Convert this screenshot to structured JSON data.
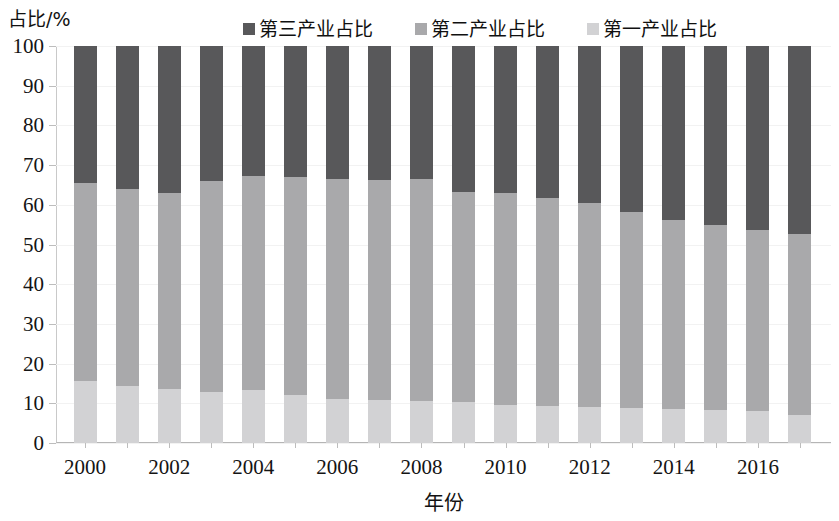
{
  "chart_data": {
    "type": "bar",
    "stacked": true,
    "title": "",
    "xlabel": "年份",
    "ylabel": "占比/%",
    "ylim": [
      0,
      100
    ],
    "yticks": [
      0,
      10,
      20,
      30,
      40,
      50,
      60,
      70,
      80,
      90,
      100
    ],
    "grid": false,
    "legend_position": "top",
    "categories": [
      "2000",
      "2001",
      "2002",
      "2003",
      "2004",
      "2005",
      "2006",
      "2007",
      "2008",
      "2009",
      "2010",
      "2011",
      "2012",
      "2013",
      "2014",
      "2015",
      "2016",
      "2017"
    ],
    "xtick_labels": [
      "2000",
      "2002",
      "2004",
      "2006",
      "2008",
      "2010",
      "2012",
      "2014",
      "2016"
    ],
    "xtick_categories": [
      "2000",
      "2002",
      "2004",
      "2006",
      "2008",
      "2010",
      "2012",
      "2014",
      "2016"
    ],
    "series": [
      {
        "name": "第一产业占比",
        "color": "#d2d2d4",
        "values": [
          15.6,
          14.4,
          13.7,
          12.8,
          13.4,
          12.1,
          11.1,
          10.8,
          10.7,
          10.3,
          9.6,
          9.2,
          9.1,
          8.9,
          8.6,
          8.4,
          8.1,
          7.0
        ]
      },
      {
        "name": "第二产业占比",
        "color": "#a9a9ab",
        "values": [
          49.9,
          49.6,
          49.3,
          53.2,
          53.9,
          54.9,
          55.4,
          55.4,
          55.9,
          53.0,
          53.4,
          52.5,
          51.3,
          49.3,
          47.5,
          46.6,
          45.5,
          45.6
        ]
      },
      {
        "name": "第三产业占比",
        "color": "#58585a",
        "values": [
          34.5,
          36.0,
          37.0,
          34.0,
          32.7,
          33.0,
          33.5,
          33.8,
          33.4,
          36.7,
          37.0,
          38.3,
          39.6,
          41.8,
          43.9,
          45.0,
          46.4,
          47.4
        ]
      }
    ]
  },
  "axes": {
    "y_title": "占比/%",
    "x_title": "年份"
  },
  "legend": {
    "items": [
      {
        "label": "第三产业占比",
        "color": "#58585a",
        "series_key": "tertiary"
      },
      {
        "label": "第二产业占比",
        "color": "#a9a9ab",
        "series_key": "secondary"
      },
      {
        "label": "第一产业占比",
        "color": "#d2d2d4",
        "series_key": "primary"
      }
    ]
  }
}
